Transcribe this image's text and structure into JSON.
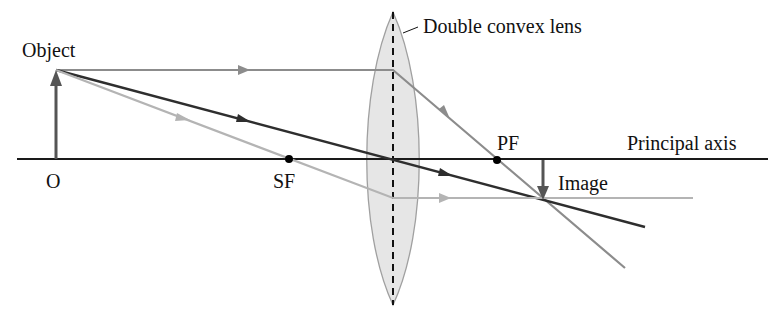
{
  "labels": {
    "object": "Object",
    "lens": "Double convex lens",
    "pf": "PF",
    "principal_axis": "Principal axis",
    "origin": "O",
    "sf": "SF",
    "image": "Image"
  },
  "colors": {
    "axis": "#1a1a1a",
    "lens_fill": "#e6e6e6",
    "lens_stroke": "#a0a0a0",
    "ray_dark": "#2e2e2e",
    "ray_mid": "#8c8c8c",
    "ray_light": "#b4b4b4",
    "arrow": "#555555"
  },
  "geometry": {
    "axis_y": 159,
    "object_x": 56,
    "object_top_y": 70,
    "lens_x": 393,
    "sf_x": 289,
    "pf_x": 497,
    "image_x": 543,
    "image_tip_y": 200
  }
}
